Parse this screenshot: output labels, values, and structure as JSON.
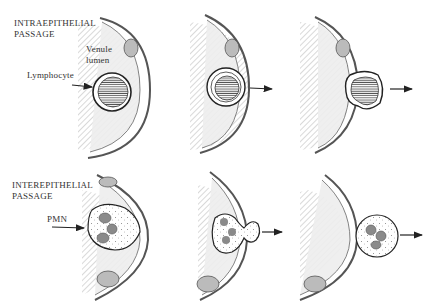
{
  "figure": {
    "rows": [
      {
        "title_line1": "INTRAEPITHELIAL",
        "title_line2": "PASSAGE",
        "labels": {
          "venule_line1": "Venule",
          "venule_line2": "lumen",
          "cell": "Lymphocyte"
        },
        "stages": 3
      },
      {
        "title_line1": "INTEREPITHELIAL",
        "title_line2": "PASSAGE",
        "labels": {
          "cell": "PMN"
        },
        "stages": 3
      }
    ]
  },
  "colors": {
    "line": "#333333",
    "hatch": "#9a9a9a",
    "wall": "#e8e8e8",
    "nucleus": "#8a8a8a",
    "background": "#ffffff"
  }
}
